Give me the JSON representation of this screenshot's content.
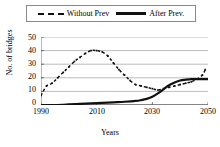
{
  "legend": {
    "entries": [
      {
        "label": "Without Prev",
        "style": "dashed",
        "color": "#111111"
      },
      {
        "label": "After Prev.",
        "style": "solid",
        "color": "#111111"
      }
    ]
  },
  "axes": {
    "y_label": "No. of bridges",
    "x_label": "Years",
    "y_ticks": [
      "0",
      "10",
      "20",
      "30",
      "40",
      "50"
    ],
    "x_ticks": [
      "1990",
      "2010",
      "2030",
      "2050"
    ]
  },
  "chart_data": {
    "type": "line",
    "title": "",
    "xlabel": "Years",
    "ylabel": "No. of bridges",
    "xlim": [
      1990,
      2050
    ],
    "ylim": [
      0,
      50
    ],
    "y_ticks": [
      0,
      10,
      20,
      30,
      40,
      50
    ],
    "x_ticks": [
      1990,
      2010,
      2030,
      2050
    ],
    "grid": "horizontal",
    "legend_position": "top",
    "series": [
      {
        "name": "Without Prev",
        "style": "dashed",
        "color": "#111111",
        "markers": true,
        "x": [
          1990,
          1992,
          1994,
          1996,
          1998,
          2000,
          2002,
          2004,
          2006,
          2008,
          2010,
          2012,
          2014,
          2016,
          2018,
          2020,
          2022,
          2024,
          2026,
          2028,
          2030,
          2032,
          2034,
          2036,
          2038,
          2040,
          2042,
          2044,
          2046,
          2048,
          2049
        ],
        "values": [
          7,
          14,
          16,
          20,
          24,
          28,
          32,
          35,
          38,
          40,
          40,
          39,
          36,
          31,
          26,
          22,
          18,
          15,
          14,
          13,
          12,
          11,
          12,
          13,
          14,
          15,
          16,
          17,
          19,
          22,
          26
        ]
      },
      {
        "name": "After Prev.",
        "style": "solid",
        "color": "#111111",
        "markers": false,
        "x": [
          1990,
          1994,
          1998,
          2000,
          2004,
          2008,
          2012,
          2016,
          2020,
          2024,
          2026,
          2028,
          2030,
          2032,
          2034,
          2036,
          2038,
          2040,
          2042,
          2044,
          2046,
          2048,
          2050
        ],
        "values": [
          0,
          0,
          0.2,
          0.4,
          0.8,
          1.2,
          1.6,
          2,
          2.4,
          3,
          3.6,
          4.5,
          6,
          8.5,
          11.5,
          14.5,
          16.5,
          18,
          18.6,
          19,
          19,
          19,
          19
        ]
      }
    ]
  }
}
